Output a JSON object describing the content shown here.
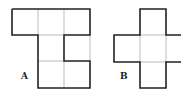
{
  "figures": [
    {
      "label": "A",
      "description": "Net of five unit squares: top row of three, one square below middle, two squares below that (middle and right)"
    },
    {
      "label": "B",
      "description": "Cross-shaped net of unit squares"
    }
  ],
  "colors": {
    "outline": "#222222",
    "inner": "#b8b8b8",
    "background": "#ffffff"
  }
}
